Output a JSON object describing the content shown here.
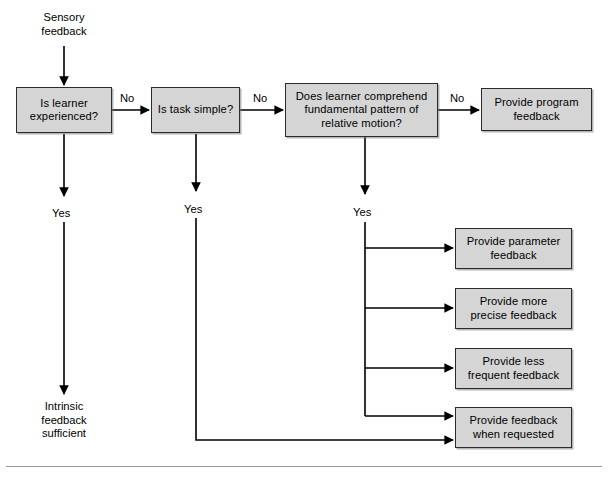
{
  "diagram": {
    "colors": {
      "node_fill": "#d5d5d5",
      "node_border": "#2b2b2b",
      "line": "#000000",
      "rule": "#9a9a9a",
      "background": "#ffffff"
    },
    "entry_label": "Sensory\nfeedback",
    "terminal_label": "Intrinsic\nfeedback\nsufficient",
    "nodes": [
      {
        "id": "q1",
        "label": "Is learner\nexperienced?",
        "type": "decision"
      },
      {
        "id": "q2",
        "label": "Is task\nsimple?",
        "type": "decision"
      },
      {
        "id": "q3",
        "label": "Does learner comprehend\nfundamental pattern of\nrelative motion?",
        "type": "decision"
      },
      {
        "id": "o1",
        "label": "Provide program\nfeedback",
        "type": "outcome"
      },
      {
        "id": "o2",
        "label": "Provide parameter\nfeedback",
        "type": "outcome"
      },
      {
        "id": "o3",
        "label": "Provide more\nprecise feedback",
        "type": "outcome"
      },
      {
        "id": "o4",
        "label": "Provide less\nfrequent feedback",
        "type": "outcome"
      },
      {
        "id": "o5",
        "label": "Provide feedback\nwhen requested",
        "type": "outcome"
      }
    ],
    "edge_labels": {
      "q1_no": "No",
      "q2_no": "No",
      "q3_no": "No",
      "q1_yes": "Yes",
      "q2_yes": "Yes",
      "q3_yes": "Yes"
    }
  }
}
